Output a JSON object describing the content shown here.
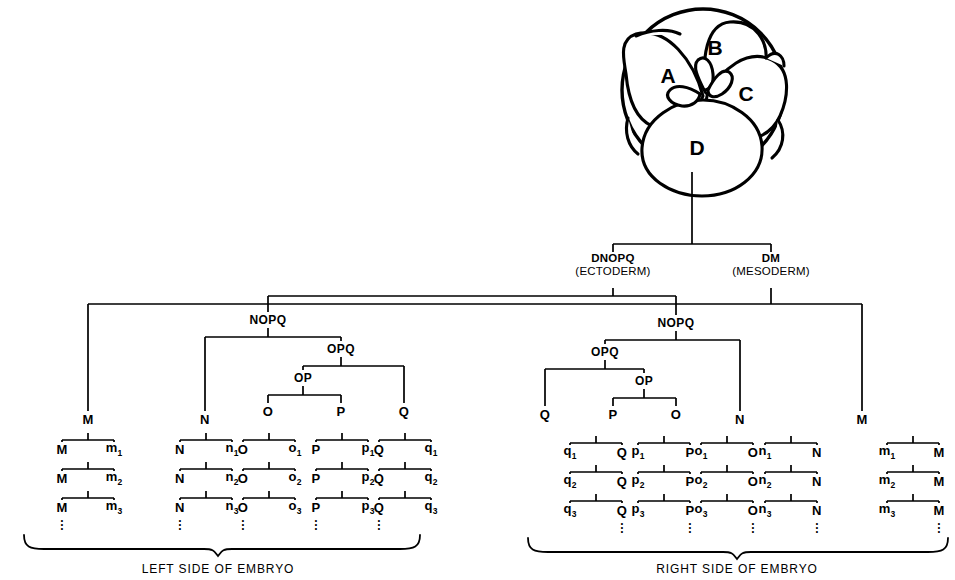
{
  "diagram": {
    "embryo": {
      "cells": [
        {
          "label": "A",
          "x": 668,
          "y": 76
        },
        {
          "label": "B",
          "x": 715,
          "y": 48
        },
        {
          "label": "C",
          "x": 746,
          "y": 94
        },
        {
          "label": "D",
          "x": 697,
          "y": 148
        }
      ]
    },
    "fates": [
      {
        "name": "DNOPQ",
        "tissue": "(ECTODERM)",
        "x": 613,
        "y": 259
      },
      {
        "name": "DM",
        "tissue": "(MESODERM)",
        "x": 771,
        "y": 259
      }
    ],
    "internal_nodes": [
      {
        "label": "NOPQ",
        "x": 268,
        "y": 320
      },
      {
        "label": "OPQ",
        "x": 341,
        "y": 349
      },
      {
        "label": "OP",
        "x": 303,
        "y": 378
      },
      {
        "label": "NOPQ",
        "x": 676,
        "y": 323
      },
      {
        "label": "OPQ",
        "x": 605,
        "y": 352
      },
      {
        "label": "OP",
        "x": 644,
        "y": 381
      }
    ],
    "founder_nodes": [
      {
        "label": "M",
        "x": 88,
        "y": 419
      },
      {
        "label": "N",
        "x": 205,
        "y": 419
      },
      {
        "label": "O",
        "x": 268,
        "y": 411
      },
      {
        "label": "P",
        "x": 341,
        "y": 411
      },
      {
        "label": "Q",
        "x": 404,
        "y": 411
      },
      {
        "label": "Q",
        "x": 545,
        "y": 414
      },
      {
        "label": "P",
        "x": 613,
        "y": 414
      },
      {
        "label": "O",
        "x": 676,
        "y": 414
      },
      {
        "label": "N",
        "x": 740,
        "y": 419
      },
      {
        "label": "M",
        "x": 862,
        "y": 419
      }
    ],
    "lineages": [
      {
        "id": "left-M",
        "stem": "M",
        "daughters": [
          "m",
          "m",
          "m"
        ],
        "stem_side": "left",
        "x": 62,
        "y": 449,
        "dx": 26,
        "dy": 29
      },
      {
        "id": "left-N",
        "stem": "N",
        "daughters": [
          "n",
          "n",
          "n"
        ],
        "stem_side": "left",
        "x": 180,
        "y": 449,
        "dx": 26,
        "dy": 29
      },
      {
        "id": "left-O",
        "stem": "O",
        "daughters": [
          "o",
          "o",
          "o"
        ],
        "stem_side": "left",
        "x": 243,
        "y": 449,
        "dx": 26,
        "dy": 29
      },
      {
        "id": "left-P",
        "stem": "P",
        "daughters": [
          "p",
          "p",
          "p"
        ],
        "stem_side": "left",
        "x": 316,
        "y": 449,
        "dx": 26,
        "dy": 29
      },
      {
        "id": "left-Q",
        "stem": "Q",
        "daughters": [
          "q",
          "q",
          "q"
        ],
        "stem_side": "left",
        "x": 379,
        "y": 449,
        "dx": 26,
        "dy": 29
      },
      {
        "id": "right-Q",
        "stem": "Q",
        "daughters": [
          "q",
          "q",
          "q"
        ],
        "stem_side": "right",
        "x": 570,
        "y": 452,
        "dx": 26,
        "dy": 29
      },
      {
        "id": "right-P",
        "stem": "P",
        "daughters": [
          "p",
          "p",
          "p"
        ],
        "stem_side": "right",
        "x": 638,
        "y": 452,
        "dx": 26,
        "dy": 29
      },
      {
        "id": "right-O",
        "stem": "O",
        "daughters": [
          "o",
          "o",
          "o"
        ],
        "stem_side": "right",
        "x": 701,
        "y": 452,
        "dx": 26,
        "dy": 29
      },
      {
        "id": "right-N",
        "stem": "N",
        "daughters": [
          "n",
          "n",
          "n"
        ],
        "stem_side": "right",
        "x": 765,
        "y": 452,
        "dx": 26,
        "dy": 29
      },
      {
        "id": "right-M",
        "stem": "M",
        "daughters": [
          "m",
          "m",
          "m"
        ],
        "stem_side": "right",
        "x": 887,
        "y": 452,
        "dx": 26,
        "dy": 29
      }
    ],
    "subscripts": [
      "1",
      "2",
      "3"
    ],
    "captions": [
      {
        "text": "LEFT SIDE OF EMBRYO",
        "x": 218,
        "y": 557
      },
      {
        "text": "RIGHT SIDE OF EMBRYO",
        "x": 737,
        "y": 557
      }
    ],
    "colors": {
      "ink": "#000000",
      "background": "#ffffff"
    }
  }
}
